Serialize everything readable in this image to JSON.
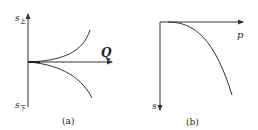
{
  "panels": [
    {
      "id": "a",
      "caption": "(a)",
      "y_axis_top_label": "s",
      "y_axis_top_sub": "上",
      "y_axis_bottom_label": "s",
      "y_axis_bottom_sub": "下",
      "x_axis_label": "Q",
      "curves": [
        "upper rising curve",
        "lower falling curve"
      ]
    },
    {
      "id": "b",
      "caption": "(b)",
      "x_axis_label": "p",
      "y_axis_label": "s",
      "curves": [
        "settlement curve bending downward"
      ]
    }
  ],
  "colors": {
    "stroke": "#333333",
    "text": "#222222",
    "background": "#ffffff"
  }
}
